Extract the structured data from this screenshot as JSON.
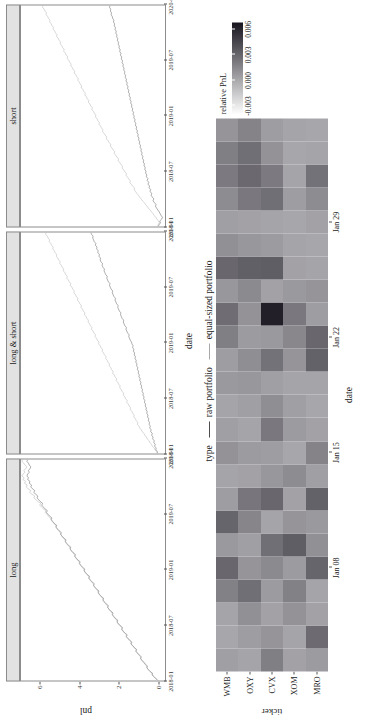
{
  "figure": {
    "line_chart": {
      "ylabel": "pnl",
      "xlabel": "date",
      "y_ticks": [
        "0",
        "2",
        "4",
        "6"
      ],
      "y_tick_values": [
        0,
        2,
        4,
        6
      ],
      "ylim": [
        -0.35,
        7.0
      ],
      "x_ticks": [
        "2018-01",
        "2018-07",
        "2019-01",
        "2019-07",
        "2020-01"
      ],
      "facets": [
        "long",
        "long & short",
        "short"
      ],
      "legend": {
        "title": "type",
        "items": [
          {
            "label": "raw portfolio",
            "color": "#4d4d4d"
          },
          {
            "label": "equal-sized portfolio",
            "color": "#a8a8a8"
          }
        ]
      }
    },
    "heatmap": {
      "ylabel": "ticker",
      "xlabel": "date",
      "tickers": [
        "WMB",
        "OXY",
        "CVX",
        "XOM",
        "MRO"
      ],
      "x_ticks": [
        "Jan 08",
        "Jan 15",
        "Jan 22",
        "Jan 29"
      ],
      "x_tick_index": [
        4,
        9,
        14,
        19
      ],
      "columns": 24,
      "legend": {
        "title": "relative PnL",
        "ticks": [
          "0.006",
          "0.003",
          "0.000",
          "-0.003"
        ],
        "tick_values": [
          0.006,
          0.003,
          0.0,
          -0.003
        ],
        "vmin": -0.004,
        "vmax": 0.0068
      }
    }
  },
  "chart_data": [
    {
      "type": "line",
      "title": "",
      "xlabel": "date",
      "ylabel": "pnl",
      "facets": [
        "long",
        "long & short",
        "short"
      ],
      "x_tick_labels": [
        "2018-01",
        "2018-07",
        "2019-01",
        "2019-07",
        "2020-01"
      ],
      "ylim": [
        0,
        7
      ],
      "legend_title": "type",
      "legend_position": "bottom",
      "grid": false,
      "series": [
        {
          "facet": "long",
          "name": "raw portfolio",
          "color": "#4d4d4d",
          "values": [
            0.02,
            0.12,
            0.2,
            0.31,
            0.29,
            0.42,
            0.5,
            0.58,
            0.55,
            0.66,
            0.74,
            0.82,
            0.9,
            0.86,
            0.97,
            1.06,
            1.13,
            1.1,
            1.21,
            1.3,
            1.38,
            1.34,
            1.45,
            1.54,
            1.62,
            1.58,
            1.7,
            1.78,
            1.86,
            1.82,
            1.93,
            2.02,
            2.1,
            2.06,
            2.18,
            2.26,
            2.34,
            2.3,
            2.42,
            2.5,
            2.58,
            2.54,
            2.66,
            2.74,
            2.82,
            2.78,
            2.9,
            2.98,
            3.06,
            3.02,
            3.14,
            3.22,
            3.3,
            3.26,
            3.38,
            3.46,
            3.54,
            3.5,
            3.62,
            3.7,
            3.78,
            3.74,
            3.86,
            3.94,
            4.02,
            3.98,
            4.1,
            4.18,
            4.26,
            4.22,
            4.34,
            4.42,
            4.5,
            4.46,
            4.58,
            4.66,
            4.74,
            4.7,
            4.82,
            4.9,
            4.98,
            4.94,
            5.06,
            5.14,
            5.22,
            5.18,
            5.3,
            5.38,
            5.46,
            5.42,
            5.54,
            5.62,
            5.7,
            5.66,
            5.78,
            5.86,
            5.94,
            5.9,
            6.02,
            6.1,
            6.18,
            6.14,
            6.26,
            6.34,
            6.3,
            6.42,
            6.5,
            6.46,
            6.58,
            6.54,
            6.66,
            6.62,
            6.7,
            6.66,
            6.58,
            6.62,
            6.54,
            6.5,
            6.58,
            6.62,
            6.7,
            6.66
          ]
        },
        {
          "facet": "long",
          "name": "equal-sized portfolio",
          "color": "#a8a8a8",
          "values": [
            0.0,
            0.1,
            0.22,
            0.28,
            0.33,
            0.4,
            0.52,
            0.55,
            0.6,
            0.68,
            0.72,
            0.84,
            0.88,
            0.9,
            1.0,
            1.04,
            1.15,
            1.12,
            1.24,
            1.28,
            1.4,
            1.38,
            1.48,
            1.52,
            1.64,
            1.62,
            1.72,
            1.8,
            1.84,
            1.86,
            1.96,
            2.04,
            2.08,
            2.12,
            2.2,
            2.28,
            2.32,
            2.36,
            2.44,
            2.52,
            2.56,
            2.6,
            2.68,
            2.76,
            2.8,
            2.84,
            2.92,
            3.0,
            3.04,
            3.08,
            3.16,
            3.24,
            3.28,
            3.32,
            3.4,
            3.48,
            3.52,
            3.56,
            3.64,
            3.72,
            3.76,
            3.8,
            3.88,
            3.96,
            4.0,
            4.04,
            4.12,
            4.2,
            4.24,
            4.28,
            4.36,
            4.44,
            4.48,
            4.52,
            4.6,
            4.68,
            4.72,
            4.76,
            4.84,
            4.92,
            4.96,
            5.0,
            5.08,
            5.16,
            5.2,
            5.24,
            5.32,
            5.4,
            5.44,
            5.52,
            5.6,
            5.68,
            5.76,
            5.74,
            5.86,
            5.96,
            6.04,
            6.0,
            6.14,
            6.24,
            6.34,
            6.3,
            6.44,
            6.56,
            6.5,
            6.64,
            6.74,
            6.68,
            6.82,
            6.76,
            6.9,
            6.84,
            6.96,
            6.9,
            6.8,
            6.86,
            6.76,
            6.7,
            6.8,
            6.86,
            6.96,
            6.9
          ]
        },
        {
          "facet": "long & short",
          "name": "raw portfolio",
          "color": "#4d4d4d",
          "values": [
            0.05,
            0.04,
            0.12,
            0.1,
            0.18,
            0.15,
            0.22,
            0.2,
            0.28,
            0.26,
            0.33,
            0.3,
            0.38,
            0.36,
            0.43,
            0.4,
            0.46,
            0.44,
            0.5,
            0.48,
            0.54,
            0.52,
            0.58,
            0.56,
            0.62,
            0.6,
            0.66,
            0.64,
            0.7,
            0.68,
            0.74,
            0.72,
            0.78,
            0.76,
            0.82,
            0.8,
            0.86,
            0.84,
            0.9,
            0.88,
            0.94,
            0.92,
            0.98,
            0.96,
            1.02,
            1.0,
            1.06,
            1.04,
            1.1,
            1.08,
            1.14,
            1.12,
            1.18,
            1.16,
            1.22,
            1.2,
            1.26,
            1.24,
            1.3,
            1.28,
            1.34,
            1.36,
            1.42,
            1.46,
            1.5,
            1.48,
            1.56,
            1.6,
            1.64,
            1.62,
            1.7,
            1.74,
            1.78,
            1.76,
            1.84,
            1.88,
            1.92,
            1.9,
            1.98,
            2.02,
            2.06,
            2.04,
            2.12,
            2.16,
            2.2,
            2.18,
            2.26,
            2.3,
            2.34,
            2.32,
            2.4,
            2.44,
            2.48,
            2.46,
            2.54,
            2.58,
            2.62,
            2.6,
            2.68,
            2.72,
            2.76,
            2.74,
            2.82,
            2.86,
            2.84,
            2.92,
            2.96,
            2.94,
            3.02,
            3.0,
            3.08,
            3.06,
            3.14,
            3.12,
            3.2,
            3.18,
            3.26,
            3.3,
            3.34,
            3.32,
            3.4,
            3.44
          ]
        },
        {
          "facet": "long & short",
          "name": "equal-sized portfolio",
          "color": "#a8a8a8",
          "values": [
            0.0,
            0.08,
            0.16,
            0.2,
            0.3,
            0.34,
            0.42,
            0.46,
            0.56,
            0.6,
            0.68,
            0.72,
            0.82,
            0.86,
            0.94,
            0.98,
            1.06,
            1.04,
            1.12,
            1.16,
            1.24,
            1.22,
            1.3,
            1.34,
            1.42,
            1.4,
            1.48,
            1.52,
            1.6,
            1.58,
            1.66,
            1.7,
            1.78,
            1.76,
            1.84,
            1.88,
            1.96,
            1.94,
            2.02,
            2.06,
            2.14,
            2.12,
            2.2,
            2.24,
            2.32,
            2.3,
            2.38,
            2.42,
            2.5,
            2.48,
            2.56,
            2.6,
            2.68,
            2.66,
            2.74,
            2.78,
            2.86,
            2.84,
            2.92,
            2.96,
            3.04,
            3.02,
            3.1,
            3.14,
            3.22,
            3.2,
            3.28,
            3.32,
            3.4,
            3.38,
            3.46,
            3.5,
            3.58,
            3.56,
            3.64,
            3.68,
            3.76,
            3.74,
            3.82,
            3.86,
            3.94,
            3.92,
            4.0,
            4.04,
            4.12,
            4.1,
            4.18,
            4.22,
            4.3,
            4.28,
            4.36,
            4.4,
            4.48,
            4.46,
            4.54,
            4.58,
            4.66,
            4.64,
            4.72,
            4.76,
            4.84,
            4.82,
            4.9,
            4.94,
            5.02,
            5.0,
            5.08,
            5.12,
            5.2,
            5.18,
            5.26,
            5.3,
            5.38,
            5.36,
            5.44,
            5.48,
            5.56,
            5.54,
            5.62,
            5.66,
            5.74,
            5.72
          ]
        },
        {
          "facet": "short",
          "name": "raw portfolio",
          "color": "#4d4d4d",
          "values": [
            0.0,
            -0.05,
            -0.12,
            -0.08,
            -0.18,
            -0.22,
            -0.15,
            -0.1,
            -0.05,
            0.02,
            0.08,
            0.14,
            0.1,
            0.2,
            0.26,
            0.22,
            0.3,
            0.36,
            0.32,
            0.42,
            0.38,
            0.46,
            0.44,
            0.52,
            0.48,
            0.56,
            0.52,
            0.6,
            0.58,
            0.64,
            0.62,
            0.68,
            0.66,
            0.72,
            0.7,
            0.76,
            0.74,
            0.8,
            0.78,
            0.84,
            0.82,
            0.88,
            0.86,
            0.92,
            0.9,
            0.96,
            0.94,
            1.0,
            0.98,
            1.04,
            1.02,
            1.08,
            1.06,
            1.12,
            1.1,
            1.16,
            1.14,
            1.2,
            1.18,
            1.24,
            1.22,
            1.28,
            1.26,
            1.32,
            1.3,
            1.36,
            1.34,
            1.4,
            1.38,
            1.44,
            1.42,
            1.48,
            1.46,
            1.52,
            1.5,
            1.56,
            1.54,
            1.6,
            1.58,
            1.64,
            1.62,
            1.68,
            1.66,
            1.72,
            1.7,
            1.76,
            1.74,
            1.8,
            1.78,
            1.84,
            1.82,
            1.88,
            1.86,
            1.92,
            1.9,
            1.96,
            1.94,
            2.0,
            1.98,
            2.04,
            2.02,
            2.08,
            2.06,
            2.12,
            2.1,
            2.16,
            2.14,
            2.2,
            2.18,
            2.24,
            2.22,
            2.28,
            2.26,
            2.32,
            2.34,
            2.4,
            2.38,
            2.44,
            2.42,
            2.48,
            2.46
          ]
        },
        {
          "facet": "short",
          "name": "equal-sized portfolio",
          "color": "#a8a8a8",
          "values": [
            0.02,
            0.0,
            -0.06,
            -0.02,
            0.06,
            0.12,
            0.2,
            0.26,
            0.34,
            0.4,
            0.5,
            0.56,
            0.64,
            0.7,
            0.8,
            0.86,
            0.94,
            1.0,
            1.08,
            1.14,
            1.22,
            1.2,
            1.3,
            1.36,
            1.44,
            1.42,
            1.5,
            1.56,
            1.64,
            1.62,
            1.7,
            1.76,
            1.84,
            1.82,
            1.9,
            1.96,
            2.04,
            2.02,
            2.1,
            2.16,
            2.24,
            2.22,
            2.3,
            2.36,
            2.44,
            2.42,
            2.5,
            2.56,
            2.64,
            2.62,
            2.7,
            2.76,
            2.84,
            2.82,
            2.9,
            2.94,
            3.02,
            3.0,
            3.08,
            3.12,
            3.2,
            3.18,
            3.26,
            3.3,
            3.38,
            3.36,
            3.44,
            3.48,
            3.56,
            3.54,
            3.62,
            3.66,
            3.74,
            3.72,
            3.8,
            3.84,
            3.92,
            3.9,
            3.98,
            4.02,
            4.1,
            4.08,
            4.16,
            4.2,
            4.28,
            4.26,
            4.34,
            4.38,
            4.46,
            4.44,
            4.52,
            4.56,
            4.64,
            4.62,
            4.7,
            4.74,
            4.82,
            4.8,
            4.88,
            4.92,
            5.0,
            4.98,
            5.06,
            5.1,
            5.18,
            5.16,
            5.24,
            5.28,
            5.36,
            5.34,
            5.42,
            5.46,
            5.54,
            5.52,
            5.6,
            5.64,
            5.72,
            5.7,
            5.78,
            5.82,
            5.9,
            5.88
          ]
        }
      ]
    },
    {
      "type": "heatmap",
      "title": "",
      "xlabel": "date",
      "ylabel": "ticker",
      "rows": [
        "WMB",
        "OXY",
        "CVX",
        "XOM",
        "MRO"
      ],
      "x_tick_labels": [
        "Jan 08",
        "Jan 15",
        "Jan 22",
        "Jan 29"
      ],
      "colorbar_title": "relative PnL",
      "colorbar_ticks": [
        0.006,
        0.003,
        0.0,
        -0.003
      ],
      "vmin": -0.004,
      "vmax": 0.0068,
      "values": [
        [
          0.0004,
          0.0001,
          0.0002,
          0.0018,
          0.003,
          0.0007,
          0.0031,
          0.0005,
          0.0002,
          0.001,
          0.0004,
          0.0002,
          0.0007,
          0.0005,
          0.0019,
          0.0027,
          0.0008,
          0.003,
          0.0011,
          0.0004,
          0.0013,
          0.0021,
          0.0019,
          0.0009
        ],
        [
          0.0002,
          0.0005,
          0.0011,
          0.0026,
          0.0009,
          0.0004,
          0.0016,
          0.0023,
          0.0003,
          0.0006,
          0.0002,
          0.0004,
          0.0008,
          0.0012,
          0.0006,
          0.001,
          0.0014,
          0.0033,
          0.0008,
          0.0003,
          0.0022,
          0.0029,
          0.0026,
          0.0017
        ],
        [
          0.0019,
          0.0009,
          0.0003,
          0.0006,
          0.0014,
          0.0026,
          0.0002,
          0.003,
          0.0008,
          0.0005,
          0.0022,
          0.0012,
          0.0004,
          0.0025,
          0.0007,
          0.0063,
          0.0003,
          0.0034,
          0.0006,
          0.0002,
          0.0026,
          0.0021,
          0.001,
          0.0005
        ],
        [
          0.0003,
          0.0002,
          0.001,
          0.0018,
          0.0006,
          0.0034,
          0.0009,
          0.0003,
          0.0013,
          0.0001,
          0.0006,
          0.0004,
          0.0002,
          0.0009,
          0.0015,
          0.0022,
          0.0007,
          0.0003,
          0.0002,
          0.0001,
          0.0005,
          0.0002,
          0.0001,
          0.0002
        ],
        [
          0.0006,
          0.0028,
          0.0003,
          0.0002,
          0.0031,
          0.0011,
          0.0007,
          0.0032,
          0.0004,
          0.0017,
          0.0003,
          0.0001,
          0.0002,
          0.0032,
          0.003,
          0.0005,
          0.0009,
          0.0002,
          0.0001,
          0.0003,
          0.0013,
          0.0025,
          0.0002,
          0.0001
        ]
      ]
    }
  ]
}
